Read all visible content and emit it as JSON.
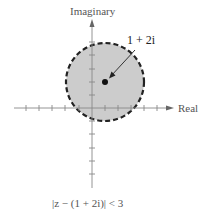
{
  "diagram": {
    "type": "complex-plane-region",
    "axes": {
      "x_label": "Real",
      "y_label": "Imaginary"
    },
    "region": {
      "center_label": "1 + 2i",
      "center": [
        1,
        2
      ],
      "radius": 3,
      "boundary": "dashed",
      "fill_color": "#cccccc",
      "boundary_color": "#222222"
    },
    "caption": "|z − (1 + 2i)| < 3"
  }
}
